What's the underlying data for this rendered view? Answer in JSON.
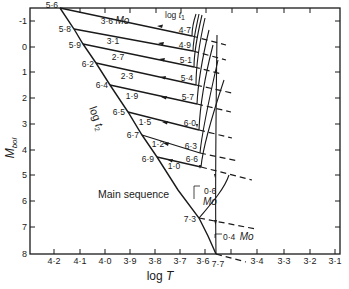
{
  "diagram": {
    "type": "hr-diagram-evolutionary-tracks",
    "y_axis": {
      "title": "M",
      "title_sub": "bol",
      "ticks": [
        "-1",
        "0",
        "1",
        "2",
        "3",
        "4",
        "5",
        "6",
        "7",
        "8"
      ],
      "range": [
        -1.5,
        8
      ]
    },
    "x_axis": {
      "title": "log T",
      "ticks": [
        "4·2",
        "4·1",
        "4·0",
        "3·9",
        "3·8",
        "3·7",
        "3·6",
        "3·4",
        "3·3",
        "3·2",
        "3·1"
      ],
      "reversed": true
    },
    "labels": {
      "log_t1": "log t",
      "log_t1_sub": "1",
      "log_t2": "log t",
      "log_t2_sub": "2",
      "main_sequence": "Main sequence",
      "end_point": "7·7"
    },
    "tracks": [
      {
        "mass": "3·6",
        "mass_unit": "Mo",
        "log_t2": "5·6",
        "log_t1": "4·7"
      },
      {
        "mass": "3·1",
        "log_t2": "5·8",
        "log_t1": "4·9"
      },
      {
        "mass": "2·7",
        "log_t2": "5·9",
        "log_t1": "5·1"
      },
      {
        "mass": "2·3",
        "log_t2": "6·2",
        "log_t1": "5·4"
      },
      {
        "mass": "1·9",
        "log_t2": "6·4",
        "log_t1": "5·7"
      },
      {
        "mass": "1·5",
        "log_t2": "6·5",
        "log_t1": "6·0"
      },
      {
        "mass": "1·2",
        "log_t2": "6·7",
        "log_t1": "6·3"
      },
      {
        "mass": "1·0",
        "log_t2": "6·9",
        "log_t1": "6·6"
      },
      {
        "mass": "0·6",
        "mass_unit": "Mo",
        "log_t2": "7·3"
      },
      {
        "mass": "0·4",
        "mass_unit": "Mo",
        "log_t2": "7·7"
      }
    ]
  }
}
